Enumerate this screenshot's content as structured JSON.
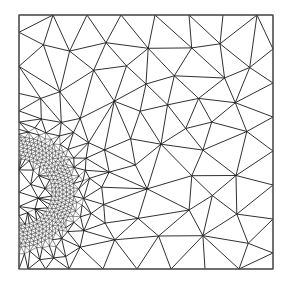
{
  "figure": {
    "colors": {
      "background": "#ffffff",
      "edge": "#1a1a1a",
      "border": "#555555"
    },
    "domain_box": {
      "x0": 19,
      "y0": 15,
      "x1": 273,
      "y1": 269
    },
    "refinement": {
      "cx": 19,
      "cy": 192,
      "r_inner": 33,
      "r_outer": 57,
      "fine_spacing": 4.2
    },
    "coarse_spacing": 34
  }
}
